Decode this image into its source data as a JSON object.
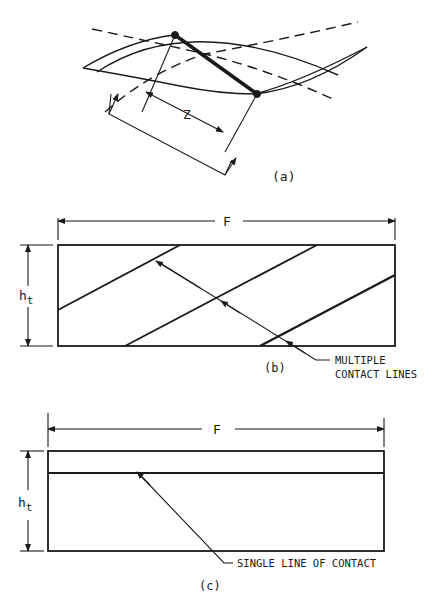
{
  "figure": {
    "panels": [
      {
        "id": "a",
        "caption": "(a)",
        "dimension_label": "Z",
        "description": "Intersecting tooth-surface curves (solid and dashed) with a bold contact segment between two dot endpoints; dimension Z measured along the projection."
      },
      {
        "id": "b",
        "caption": "(b)",
        "width_label": "F",
        "height_label_base": "h",
        "height_label_sub": "t",
        "callout": [
          "MULTIPLE",
          "CONTACT LINES"
        ],
        "contact_line_count": 3
      },
      {
        "id": "c",
        "caption": "(c)",
        "width_label": "F",
        "height_label_base": "h",
        "height_label_sub": "t",
        "callout": [
          "SINGLE LINE OF CONTACT"
        ],
        "contact_line_count": 1
      }
    ]
  },
  "colors": {
    "ink": "#1a1a1a",
    "background": "#ffffff"
  }
}
